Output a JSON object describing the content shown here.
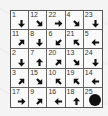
{
  "puzzle": {
    "rows": 5,
    "cols": 5,
    "cells": [
      [
        {
          "n": "1",
          "dir": "S"
        },
        {
          "n": "12",
          "dir": "SE"
        },
        {
          "n": "22",
          "dir": "E"
        },
        {
          "n": "4",
          "dir": "SE"
        },
        {
          "n": "23",
          "dir": "S"
        }
      ],
      [
        {
          "n": "11",
          "dir": "NE"
        },
        {
          "n": "8",
          "dir": "S"
        },
        {
          "n": "6",
          "dir": "SW"
        },
        {
          "n": "21",
          "dir": "NW"
        },
        {
          "n": "5",
          "dir": "W"
        }
      ],
      [
        {
          "n": "2",
          "dir": "S"
        },
        {
          "n": "7",
          "dir": "N"
        },
        {
          "n": "20",
          "dir": "NE"
        },
        {
          "n": "13",
          "dir": "SE"
        },
        {
          "n": "24",
          "dir": "S"
        }
      ],
      [
        {
          "n": "3",
          "dir": "NE"
        },
        {
          "n": "15",
          "dir": "SE"
        },
        {
          "n": "10",
          "dir": "NW"
        },
        {
          "n": "19",
          "dir": "NW"
        },
        {
          "n": "14",
          "dir": "W"
        }
      ],
      [
        {
          "n": "17",
          "dir": "E"
        },
        {
          "n": "9",
          "dir": "NE"
        },
        {
          "n": "16",
          "dir": "W"
        },
        {
          "n": "18",
          "dir": "N"
        },
        {
          "n": "25",
          "dir": "END"
        }
      ]
    ],
    "end_marker": "filled-circle",
    "colors": {
      "arrow": "#111111",
      "grid": "#666666",
      "cell_bg": "#fafafa"
    }
  }
}
